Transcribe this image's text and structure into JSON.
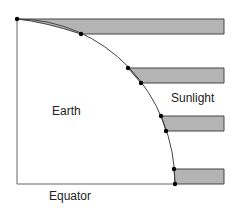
{
  "labels": {
    "earth": "Earth",
    "sunlight": "Sunlight",
    "equator": "Equator"
  },
  "colors": {
    "band_fill": "#b4b4b4",
    "line": "#444444",
    "dot": "#000000"
  },
  "diagram": {
    "bands": [
      {
        "top_y": 19,
        "bottom_y": 34,
        "surface_top": [
          17,
          19
        ],
        "surface_bottom": [
          81,
          34
        ]
      },
      {
        "top_y": 68,
        "bottom_y": 83,
        "surface_top": [
          128,
          68
        ],
        "surface_bottom": [
          141,
          83
        ]
      },
      {
        "top_y": 116,
        "bottom_y": 131,
        "surface_top": [
          161,
          116
        ],
        "surface_bottom": [
          166,
          131
        ]
      },
      {
        "top_y": 169,
        "bottom_y": 184,
        "surface_top": [
          174,
          169
        ],
        "surface_bottom": [
          175,
          184
        ]
      }
    ]
  }
}
